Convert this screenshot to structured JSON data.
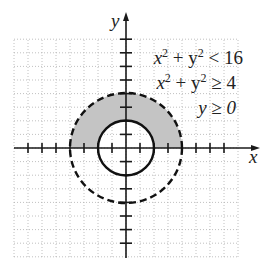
{
  "chart_data": {
    "type": "region",
    "title": "",
    "xlabel": "x",
    "ylabel": "y",
    "xlim": [
      -8,
      8
    ],
    "ylim": [
      -8,
      8
    ],
    "grid": true,
    "tick_spacing": 1,
    "inequalities": [
      "x² + y² < 16",
      "x² + y² ≥ 4",
      "y ≥ 0"
    ],
    "curves": [
      {
        "name": "outer circle",
        "center": [
          0,
          0
        ],
        "radius": 4,
        "style": "dashed",
        "boundary_included": false
      },
      {
        "name": "inner circle",
        "center": [
          0,
          0
        ],
        "radius": 2,
        "style": "solid",
        "boundary_included": true
      }
    ],
    "shaded_region": "upper half annulus between r=2 and r=4 (y >= 0)",
    "colors": {
      "shade": "#c4c4c4",
      "axes": "#1a1a1a",
      "grid": "#b0b0b0"
    }
  },
  "labels": {
    "x_axis": "x",
    "y_axis": "y",
    "ineq1_lhs": "x",
    "ineq1_rest": " + y",
    "ineq1_rhs": " < 16",
    "ineq2_lhs": "x",
    "ineq2_rest": " + y",
    "ineq2_rhs": " ≥ 4",
    "ineq3": "y ≥ 0",
    "sup": "2"
  }
}
